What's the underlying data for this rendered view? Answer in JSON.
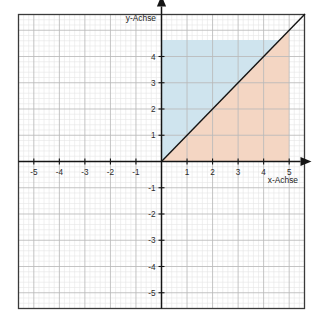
{
  "chart_data": {
    "type": "area",
    "title": "",
    "xlabel": "x-Achse",
    "ylabel": "y-Achse",
    "xlim": [
      -5.6,
      5.6
    ],
    "ylim": [
      -5.6,
      5.6
    ],
    "grid": true,
    "minor_grid": true,
    "minor_per_unit": 5,
    "legend": "none",
    "x_ticks": [
      -5,
      -4,
      -3,
      -2,
      -1,
      1,
      2,
      3,
      4,
      5
    ],
    "y_ticks": [
      -5,
      -4,
      -3,
      -2,
      -1,
      1,
      2,
      3,
      4
    ],
    "x_tick_labels": [
      "-5",
      "-4",
      "-3",
      "-2",
      "-1",
      "1",
      "2",
      "3",
      "4",
      "5"
    ],
    "y_tick_labels": [
      "-5",
      "-4",
      "-3",
      "-2",
      "-1",
      "1",
      "2",
      "3",
      "4"
    ],
    "series": [
      {
        "name": "y = x",
        "type": "line",
        "x": [
          0,
          5.6
        ],
        "y": [
          0,
          5.6
        ],
        "color": "#141414",
        "width": 1.4
      },
      {
        "name": "Region oberhalb y = x",
        "type": "region",
        "fill": "#cfe4ee",
        "vertices": [
          [
            0,
            0
          ],
          [
            0,
            4.63
          ],
          [
            4.63,
            4.63
          ]
        ]
      },
      {
        "name": "Region unterhalb y = x",
        "type": "region",
        "fill": "#f4d6c3",
        "vertices": [
          [
            0,
            0
          ],
          [
            5,
            0
          ],
          [
            5,
            5
          ]
        ]
      }
    ],
    "colors": {
      "frame": "#3a3a3a",
      "axis": "#141414",
      "major_grid": "#b9b9b9",
      "minor_grid": "#e6e6e6",
      "line": "#141414",
      "region_upper": "#cfe4ee",
      "region_lower": "#f4d6c3",
      "background": "#ffffff",
      "tick_text": "#2a2a2a"
    }
  },
  "axes": {
    "x_label": "x-Achse",
    "y_label": "y-Achse"
  }
}
